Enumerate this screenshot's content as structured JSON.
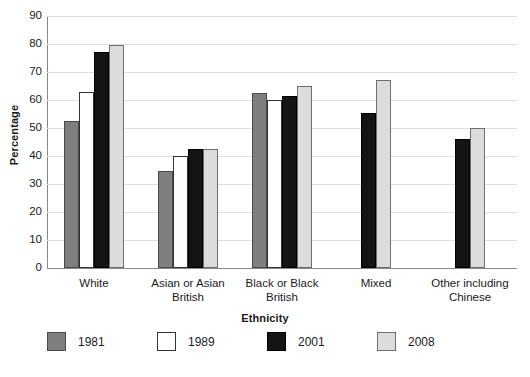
{
  "chart_data": {
    "type": "bar",
    "title": "",
    "xlabel": "Ethnicity",
    "ylabel": "Percentage",
    "ylim": [
      0,
      90
    ],
    "ytick_step": 10,
    "yticks": [
      90,
      80,
      70,
      60,
      50,
      40,
      30,
      20,
      10,
      0
    ],
    "grid": true,
    "legend_position": "bottom",
    "categories": [
      "White",
      "Asian or Asian British",
      "Black or Black British",
      "Mixed",
      "Other including Chinese"
    ],
    "category_lines": [
      [
        "White"
      ],
      [
        "Asian or Asian",
        "British"
      ],
      [
        "Black or Black",
        "British"
      ],
      [
        "Mixed"
      ],
      [
        "Other including",
        "Chinese"
      ]
    ],
    "series": [
      {
        "name": "1981",
        "color": "#7f7f7f",
        "values": [
          52.5,
          34.5,
          62.5,
          null,
          null
        ]
      },
      {
        "name": "1989",
        "color": "#ffffff",
        "values": [
          63.0,
          40.0,
          60.0,
          null,
          null
        ]
      },
      {
        "name": "2001",
        "color": "#141414",
        "values": [
          77.0,
          42.5,
          61.5,
          55.5,
          46.0
        ]
      },
      {
        "name": "2008",
        "color": "#dcdcdc",
        "values": [
          79.5,
          42.5,
          65.0,
          67.0,
          50.0
        ]
      }
    ]
  },
  "legend": {
    "items": [
      {
        "label": "1981",
        "swatch_class": "s1981"
      },
      {
        "label": "1989",
        "swatch_class": "s1989"
      },
      {
        "label": "2001",
        "swatch_class": "s2001"
      },
      {
        "label": "2008",
        "swatch_class": "s2008"
      }
    ]
  }
}
